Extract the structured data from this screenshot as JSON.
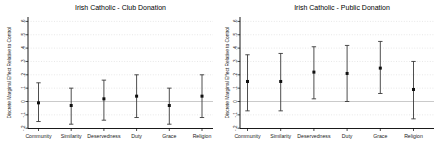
{
  "page": {
    "background": "#ffffff",
    "description_colors": {
      "axis": "#000000",
      "errorbar": "#3a3a3a",
      "marker": "#111111",
      "grid_line": "#d6d6d6",
      "zero_line": "#bdbdbd"
    }
  },
  "chart_data": [
    {
      "type": "scatter",
      "subtype": "errorbar",
      "title": "Irish Catholic - Club Donation",
      "xlabel": "",
      "ylabel": "Discrete Marginal Effect Relative to Control",
      "categories": [
        "Community",
        "Similarity",
        "Deservedness",
        "Duty",
        "Grace",
        "Religion"
      ],
      "estimates": [
        -0.01,
        -0.03,
        0.02,
        0.04,
        -0.03,
        0.04
      ],
      "ci_low": [
        -0.15,
        -0.17,
        -0.14,
        -0.12,
        -0.17,
        -0.12
      ],
      "ci_high": [
        0.14,
        0.1,
        0.16,
        0.2,
        0.1,
        0.2
      ],
      "ylim": [
        -0.2,
        0.6
      ],
      "yticks": [
        -0.2,
        -0.1,
        0,
        0.1,
        0.2,
        0.3,
        0.4,
        0.5,
        0.6
      ],
      "ytick_labels": [
        "-.2",
        "-.1",
        "0",
        ".1",
        ".2",
        ".3",
        ".4",
        ".5",
        ".6"
      ],
      "grid": true,
      "legend": "none",
      "marker": "filled-square"
    },
    {
      "type": "scatter",
      "subtype": "errorbar",
      "title": "Irish Catholic - Public Donation",
      "xlabel": "",
      "ylabel": "Discrete Marginal Effect Relative to Control",
      "categories": [
        "Community",
        "Similarity",
        "Deservedness",
        "Duty",
        "Grace",
        "Religion"
      ],
      "estimates": [
        0.15,
        0.15,
        0.22,
        0.21,
        0.25,
        0.09
      ],
      "ci_low": [
        -0.07,
        -0.07,
        0.02,
        0.0,
        0.06,
        -0.13
      ],
      "ci_high": [
        0.35,
        0.36,
        0.41,
        0.42,
        0.45,
        0.3
      ],
      "ylim": [
        -0.2,
        0.6
      ],
      "yticks": [
        -0.2,
        -0.1,
        0,
        0.1,
        0.2,
        0.3,
        0.4,
        0.5,
        0.6
      ],
      "ytick_labels": [
        "-.2",
        "-.1",
        "0",
        ".1",
        ".2",
        ".3",
        ".4",
        ".5",
        ".6"
      ],
      "grid": true,
      "legend": "none",
      "marker": "filled-square"
    }
  ],
  "colors": {
    "axis": "#000000",
    "errorbar": "#3a3a3a",
    "marker": "#111111",
    "grid_line": "#d6d6d6",
    "zero_line": "#bdbdbd"
  }
}
